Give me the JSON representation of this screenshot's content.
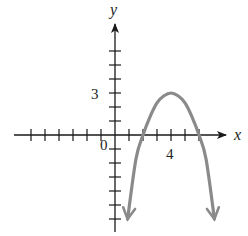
{
  "chart_data": {
    "type": "line",
    "title": "",
    "xlabel": "x",
    "ylabel": "y",
    "origin_label": "0",
    "tick_labels": {
      "x": [
        {
          "value": 4,
          "label": "4"
        }
      ],
      "y": [
        {
          "value": 3,
          "label": "3"
        }
      ]
    },
    "xlim": [
      -7,
      7
    ],
    "ylim": [
      -7,
      7
    ],
    "x_ticks": [
      -6,
      -5,
      -4,
      -3,
      -2,
      -1,
      1,
      2,
      3,
      4,
      5,
      6
    ],
    "y_ticks": [
      -6,
      -5,
      -4,
      -3,
      -2,
      -1,
      1,
      2,
      3,
      4,
      5,
      6
    ],
    "grid": false,
    "legend": null,
    "series": [
      {
        "name": "parabola",
        "description": "Downward-opening parabola with vertex (4, 3), x-intercepts at 2 and 6, arrows at both ends",
        "equation": "y = -3/4 (x - 4)^2 + 3",
        "vertex": [
          4,
          3
        ],
        "x_intercepts": [
          2,
          6
        ],
        "x": [
          0.9,
          1.5,
          2,
          2.5,
          3,
          3.5,
          4,
          4.5,
          5,
          5.5,
          6,
          6.5,
          7.1
        ],
        "y": [
          -6.0,
          -1.7,
          0,
          1.3,
          2.3,
          2.8,
          3,
          2.8,
          2.3,
          1.3,
          0,
          -1.7,
          -6.0
        ],
        "color": "#8a8a8a"
      }
    ]
  },
  "axes": {
    "x_label": "x",
    "y_label": "y",
    "origin": "0",
    "x_tick_label": "4",
    "y_tick_label": "3"
  },
  "colors": {
    "axis": "#1a1a1a",
    "curve": "#8a8a8a"
  }
}
